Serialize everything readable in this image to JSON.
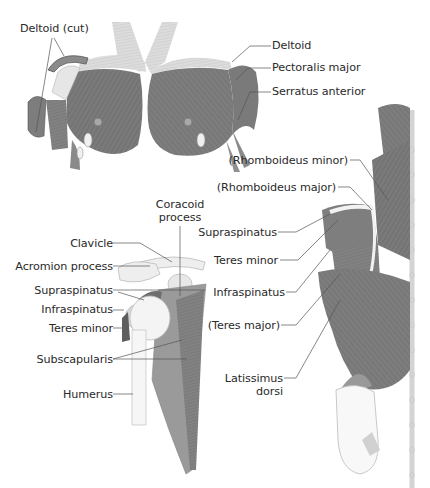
{
  "diagram": {
    "views": [
      {
        "id": "anterior-chest",
        "labels": {
          "deltoid_cut": "Deltoid (cut)",
          "deltoid": "Deltoid",
          "pectoralis_major": "Pectoralis major",
          "serratus_anterior": "Serratus anterior"
        }
      },
      {
        "id": "scapula-lateral",
        "labels": {
          "coracoid_line1": "Coracoid",
          "coracoid_line2": "process",
          "clavicle": "Clavicle",
          "acromion_process": "Acromion process",
          "supraspinatus": "Supraspinatus",
          "infraspinatus": "Infraspinatus",
          "teres_minor": "Teres minor",
          "subscapularis": "Subscapularis",
          "humerus": "Humerus"
        }
      },
      {
        "id": "posterior-back",
        "labels": {
          "rhomboideus_minor": "(Rhomboideus minor)",
          "rhomboideus_major": "(Rhomboideus major)",
          "supraspinatus": "Supraspinatus",
          "teres_minor": "Teres minor",
          "infraspinatus": "Infraspinatus",
          "teres_major": "(Teres major)",
          "latissimus_line1": "Latissimus",
          "latissimus_line2": "dorsi"
        }
      }
    ],
    "colors": {
      "muscle_dark": "#6e6e6e",
      "muscle_mid": "#8c8c8c",
      "muscle_light": "#b4b4b4",
      "bone": "#ececec",
      "leader_line": "#555555",
      "text": "#2a2a2a"
    }
  }
}
